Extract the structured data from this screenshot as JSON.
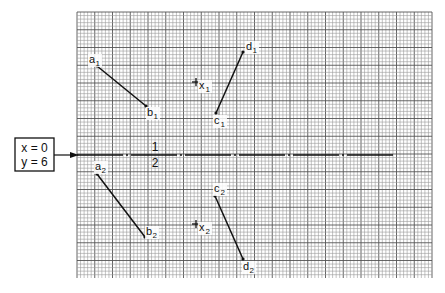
{
  "figure": {
    "grid": {
      "x0": 77,
      "y0": 12,
      "x1": 432,
      "y1": 278,
      "pitch": 3.55,
      "major_every": 5
    },
    "origin_box": {
      "line1": "x = 0",
      "line2": "y = 6"
    },
    "axis": {
      "fraction_numerator": "1",
      "fraction_denominator": "2"
    },
    "segments": [
      {
        "name": "a1-b1",
        "start": {
          "label": "a",
          "sub": "1",
          "x": 97,
          "y": 66
        },
        "end": {
          "label": "b",
          "sub": "1",
          "x": 146,
          "y": 106
        }
      },
      {
        "name": "c1-d1",
        "start": {
          "label": "c",
          "sub": "1",
          "x": 216,
          "y": 113
        },
        "end": {
          "label": "d",
          "sub": "1",
          "x": 243,
          "y": 52
        }
      },
      {
        "name": "a2-b2",
        "start": {
          "label": "a",
          "sub": "2",
          "x": 97,
          "y": 174
        },
        "end": {
          "label": "b",
          "sub": "2",
          "x": 145,
          "y": 237
        }
      },
      {
        "name": "c2-d2",
        "start": {
          "label": "c",
          "sub": "2",
          "x": 215,
          "y": 196
        },
        "end": {
          "label": "d",
          "sub": "2",
          "x": 243,
          "y": 259
        }
      }
    ],
    "points": [
      {
        "label": "x",
        "sub": "1",
        "x": 196,
        "y": 82
      },
      {
        "label": "x",
        "sub": "2",
        "x": 196,
        "y": 224
      }
    ]
  }
}
